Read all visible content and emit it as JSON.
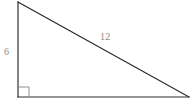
{
  "figure": {
    "kind": "right-triangle-diagram",
    "background_color": "#ffffff",
    "line_color": "#2e2e2e",
    "label_color": "#8a8a8a",
    "right_angle_mark_color": "#8f8f8f",
    "vertices": {
      "apex": {
        "x": 18,
        "y": 2
      },
      "right_angle": {
        "x": 18,
        "y": 97
      },
      "base_right": {
        "x": 189,
        "y": 97
      }
    },
    "right_angle_marker": {
      "x": 19,
      "y": 87,
      "size": 10,
      "at_vertex": "right_angle"
    },
    "labels": {
      "vertical_leg": "6",
      "hypotenuse": "12",
      "base_leg": ""
    }
  }
}
